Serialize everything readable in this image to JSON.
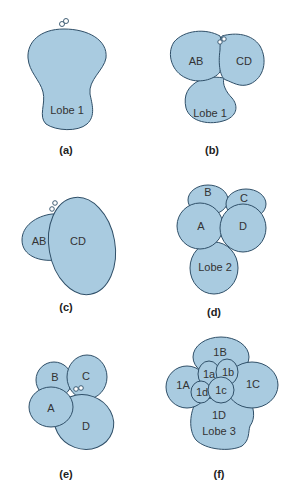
{
  "panels": [
    {
      "caption": "(a)",
      "labels": [
        "Lobe 1"
      ]
    },
    {
      "caption": "(b)",
      "labels": [
        "AB",
        "CD",
        "Lobe 1"
      ]
    },
    {
      "caption": "(c)",
      "labels": [
        "AB",
        "CD"
      ]
    },
    {
      "caption": "(d)",
      "labels": [
        "B",
        "C",
        "A",
        "D",
        "Lobe 2"
      ]
    },
    {
      "caption": "(e)",
      "labels": [
        "B",
        "C",
        "A",
        "D"
      ]
    },
    {
      "caption": "(f)",
      "labels": [
        "1B",
        "1a",
        "1b",
        "1A",
        "1C",
        "1d",
        "1c",
        "1D",
        "Lobe 3"
      ]
    }
  ],
  "colors": {
    "fill": "#a9cbe0",
    "stroke": "#2f4f68"
  }
}
